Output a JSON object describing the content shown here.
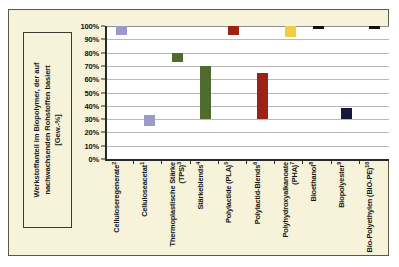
{
  "chart_data": {
    "type": "bar",
    "subtype": "floating-range-bar",
    "title": "",
    "xlabel": "",
    "ylabel": "Werkstoffanteil im Biopolymer, der auf nachwachsenden Rohstoffen basiert [Gew.-%]",
    "ylim": [
      0,
      100
    ],
    "grid": true,
    "legend": "none",
    "ytick_labels": [
      "100%",
      "90%",
      "80%",
      "70%",
      "60%",
      "50%",
      "40%",
      "30%",
      "20%",
      "10%",
      "0%"
    ],
    "ytick_values": [
      100,
      90,
      80,
      70,
      60,
      50,
      40,
      30,
      20,
      10,
      0
    ],
    "categories": [
      "Celluloseregenerate",
      "Celluloseacetat",
      "Thermoplastische Stärke (TPS)",
      "Stärkeblends",
      "Polylactide (PLA)",
      "Polylactid-Blends",
      "Polyhydroxyalkanoate (PHA)",
      "Bioethanol",
      "Biopolyester",
      "Bio-Polyethylen (BIO-PE)"
    ],
    "category_footnotes": [
      "2",
      "1",
      "3",
      "4",
      "5",
      "6",
      "7",
      "8",
      "9",
      "10"
    ],
    "bars": [
      {
        "category": "Celluloseregenerate",
        "footnote": "2",
        "low": 93,
        "high": 100,
        "color": "#9a99c8"
      },
      {
        "category": "Celluloseacetat",
        "footnote": "1",
        "low": 25,
        "high": 33,
        "color": "#9a99c8"
      },
      {
        "category": "Thermoplastische Stärke (TPS)",
        "footnote": "3",
        "low": 73,
        "high": 80,
        "color": "#4f6b2e"
      },
      {
        "category": "Stärkeblends",
        "footnote": "4",
        "low": 30,
        "high": 70,
        "color": "#4f6b2e"
      },
      {
        "category": "Polylactide (PLA)",
        "footnote": "5",
        "low": 93,
        "high": 100,
        "color": "#9c2216"
      },
      {
        "category": "Polylactid-Blends",
        "footnote": "6",
        "low": 30,
        "high": 65,
        "color": "#9c2216"
      },
      {
        "category": "Polyhydroxyalkanoate (PHA)",
        "footnote": "7",
        "low": 92,
        "high": 100,
        "color": "#f6cc3f"
      },
      {
        "category": "Bioethanol",
        "footnote": "8",
        "low": 98,
        "high": 100,
        "color": "#111111"
      },
      {
        "category": "Biopolyester",
        "footnote": "9",
        "low": 30,
        "high": 38,
        "color": "#16183c"
      },
      {
        "category": "Bio-Polyethylen (BIO-PE)",
        "footnote": "10",
        "low": 98,
        "high": 100,
        "color": "#111111"
      }
    ]
  },
  "axis": {
    "y_title": "Werkstoffanteil im Biopolymer, der auf nachwachsenden Rohstoffen basiert",
    "y_unit": "[Gew.-%]",
    "y_labels": [
      "100%",
      "90%",
      "80%",
      "70%",
      "60%",
      "50%",
      "40%",
      "30%",
      "20%",
      "10%",
      "0%"
    ],
    "x_labels": [
      {
        "text": "Celluloseregenerate",
        "note": "2"
      },
      {
        "text": "Celluloseacetat",
        "note": "1"
      },
      {
        "text": "Thermoplastische Stärke (TPS)",
        "note": "3"
      },
      {
        "text": "Stärkeblends",
        "note": "4"
      },
      {
        "text": "Polylactide (PLA)",
        "note": "5"
      },
      {
        "text": "Polylactid-Blends",
        "note": "6"
      },
      {
        "text": "Polyhydroxyalkanoate (PHA)",
        "note": "7"
      },
      {
        "text": "Bioethanol",
        "note": "8"
      },
      {
        "text": "Biopolyester",
        "note": "9"
      },
      {
        "text": "Bio-Polyethylen (BIO-PE)",
        "note": "10"
      }
    ]
  },
  "colors": {
    "panel_background": "#f6f3da",
    "panel_border": "#5b5a42",
    "plot_background": "#ffffff",
    "axis_line": "#2a2a2a",
    "gridline": "#b9b9b9"
  }
}
